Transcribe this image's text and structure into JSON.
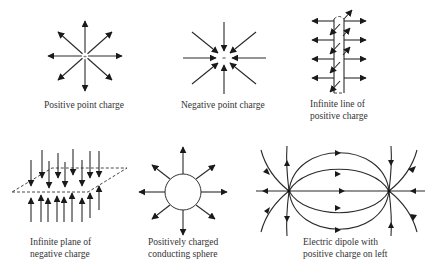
{
  "figure": {
    "panels": [
      {
        "id": "positive-point-charge",
        "caption_lines": [
          "Positive point charge"
        ],
        "center_symbol": "+"
      },
      {
        "id": "negative-point-charge",
        "caption_lines": [
          "Negative point charge"
        ],
        "center_symbol": "-"
      },
      {
        "id": "infinite-line-positive",
        "caption_lines": [
          "Infinite line of",
          "positive charge"
        ]
      },
      {
        "id": "infinite-plane-negative",
        "caption_lines": [
          "Infinite plane of",
          "negative charge"
        ]
      },
      {
        "id": "conducting-sphere",
        "caption_lines": [
          "Positively charged",
          "conducting sphere"
        ]
      },
      {
        "id": "electric-dipole",
        "caption_lines": [
          "Electric dipole with",
          "positive charge on left"
        ]
      }
    ],
    "colors": {
      "line": "#2a2a2a",
      "text": "#333333",
      "background": "#ffffff"
    }
  }
}
